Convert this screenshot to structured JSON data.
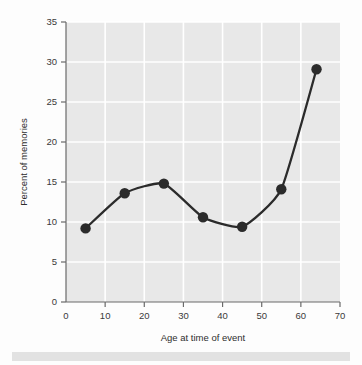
{
  "chart_data": {
    "type": "line",
    "title": "",
    "xlabel": "Age at time of event",
    "ylabel": "Percent of memories",
    "xlim": [
      0,
      70
    ],
    "ylim": [
      0,
      35
    ],
    "grid": true,
    "legend": "none",
    "marker": "filled-circle",
    "line_color": "#2b2b2b",
    "marker_color": "#2b2b2b",
    "plot_bg_color": "#e8e8e8",
    "grid_color": "#ffffff",
    "x": [
      5,
      15,
      25,
      35,
      45,
      55,
      64
    ],
    "values": [
      9.2,
      13.6,
      14.8,
      10.6,
      9.4,
      14.1,
      29.1
    ],
    "xticks": [
      "0",
      "10",
      "20",
      "30",
      "40",
      "50",
      "60",
      "70"
    ],
    "xtick_values": [
      0,
      10,
      20,
      30,
      40,
      50,
      60,
      70
    ],
    "yticks": [
      "0",
      "5",
      "10",
      "15",
      "20",
      "25",
      "30",
      "35"
    ],
    "ytick_values": [
      0,
      5,
      10,
      15,
      20,
      25,
      30,
      35
    ]
  },
  "axes": {
    "x_title": "Age at time of event",
    "y_title": "Percent of memories"
  }
}
